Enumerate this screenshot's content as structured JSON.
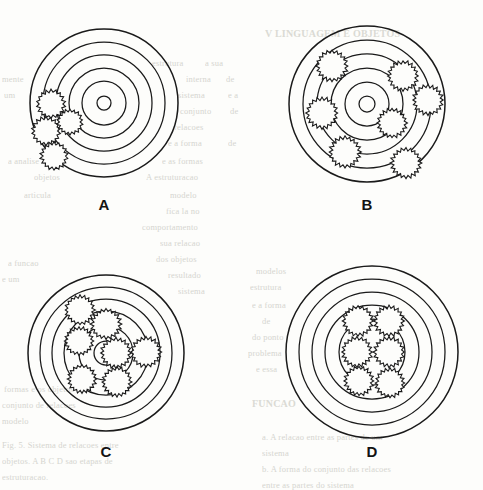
{
  "figure": {
    "kind": "scanned-textbook-figure",
    "background_color": "#fdfdfb",
    "ink_color": "#1a1a1a",
    "bleed_text_color": "#cfcfc9",
    "panel_count": 4
  },
  "panels": [
    {
      "id": "A",
      "label": "A",
      "label_x": 104,
      "label_y": 196,
      "center": {
        "x": 104,
        "y": 103
      },
      "rings": [
        74,
        61,
        48,
        35,
        22,
        7
      ],
      "ring_count": 6,
      "gear_count": 4,
      "gear_teeth": 18,
      "gears": [
        {
          "cx": 51,
          "cy": 104,
          "r": 14.5
        },
        {
          "cx": 46,
          "cy": 131,
          "r": 14.5
        },
        {
          "cx": 70,
          "cy": 122,
          "r": 13.0
        },
        {
          "cx": 54,
          "cy": 156,
          "r": 14.0
        }
      ],
      "description": "Four gears clustered along the left flank, overlapping the outer rings."
    },
    {
      "id": "B",
      "label": "B",
      "label_x": 367,
      "label_y": 196,
      "center": {
        "x": 367,
        "y": 104
      },
      "rings": [
        78,
        64,
        50,
        36,
        22,
        8
      ],
      "ring_count": 6,
      "gear_count": 7,
      "gear_teeth": 20,
      "gears": [
        {
          "cx": 332,
          "cy": 66,
          "r": 16.0
        },
        {
          "cx": 403,
          "cy": 76,
          "r": 15.5
        },
        {
          "cx": 428,
          "cy": 100,
          "r": 15.5
        },
        {
          "cx": 322,
          "cy": 113,
          "r": 16.0
        },
        {
          "cx": 392,
          "cy": 123,
          "r": 15.0
        },
        {
          "cx": 345,
          "cy": 152,
          "r": 16.0
        },
        {
          "cx": 406,
          "cy": 163,
          "r": 15.5
        }
      ],
      "description": "Seven gears spread evenly across the middle and outer rings."
    },
    {
      "id": "C",
      "label": "C",
      "label_x": 106,
      "label_y": 443,
      "center": {
        "x": 106,
        "y": 353
      },
      "rings": [
        78,
        66,
        54,
        42,
        27,
        12
      ],
      "ring_count": 6,
      "gear_count": 7,
      "gear_teeth": 20,
      "gears": [
        {
          "cx": 80,
          "cy": 310,
          "r": 15.0
        },
        {
          "cx": 106,
          "cy": 324,
          "r": 15.5
        },
        {
          "cx": 79,
          "cy": 341,
          "r": 14.5
        },
        {
          "cx": 116,
          "cy": 353,
          "r": 15.5
        },
        {
          "cx": 146,
          "cy": 352,
          "r": 15.5
        },
        {
          "cx": 82,
          "cy": 379,
          "r": 14.5
        },
        {
          "cx": 117,
          "cy": 382,
          "r": 15.0
        }
      ],
      "description": "Seven gears packed into the inner half of the disc."
    },
    {
      "id": "D",
      "label": "D",
      "label_x": 372,
      "label_y": 443,
      "center": {
        "x": 372,
        "y": 352
      },
      "rings": [
        86,
        73,
        60,
        47,
        33
      ],
      "ring_count": 5,
      "gear_count": 6,
      "gear_teeth": 20,
      "gears": [
        {
          "cx": 358,
          "cy": 321,
          "r": 15.5
        },
        {
          "cx": 389,
          "cy": 321,
          "r": 15.5
        },
        {
          "cx": 357,
          "cy": 352,
          "r": 15.5
        },
        {
          "cx": 389,
          "cy": 352,
          "r": 15.5
        },
        {
          "cx": 359,
          "cy": 381,
          "r": 15.0
        },
        {
          "cx": 390,
          "cy": 383,
          "r": 15.0
        }
      ],
      "description": "Six gears in a tight two-by-three block at the core."
    }
  ],
  "bleed_text": [
    {
      "text": "V LINGUAGEM E OBJETOS",
      "x": 265,
      "y": 28,
      "bold": true
    },
    {
      "text": "estrutura",
      "x": 152,
      "y": 58
    },
    {
      "text": "a sua",
      "x": 205,
      "y": 58
    },
    {
      "text": "mente",
      "x": 2,
      "y": 74
    },
    {
      "text": "interna",
      "x": 186,
      "y": 74
    },
    {
      "text": "de",
      "x": 226,
      "y": 74
    },
    {
      "text": "um",
      "x": 4,
      "y": 90
    },
    {
      "text": "sistema",
      "x": 178,
      "y": 90
    },
    {
      "text": "e a",
      "x": 228,
      "y": 90
    },
    {
      "text": "conjunto",
      "x": 180,
      "y": 106
    },
    {
      "text": "de",
      "x": 230,
      "y": 106
    },
    {
      "text": "relacoes",
      "x": 174,
      "y": 122
    },
    {
      "text": "e a forma",
      "x": 168,
      "y": 138
    },
    {
      "text": "de",
      "x": 228,
      "y": 138
    },
    {
      "text": "a analise",
      "x": 8,
      "y": 156
    },
    {
      "text": "e as formas",
      "x": 162,
      "y": 156
    },
    {
      "text": "objetos",
      "x": 34,
      "y": 172
    },
    {
      "text": "A estruturacao",
      "x": 146,
      "y": 172
    },
    {
      "text": "modelo",
      "x": 170,
      "y": 190
    },
    {
      "text": "articula",
      "x": 24,
      "y": 190
    },
    {
      "text": "fica la no",
      "x": 166,
      "y": 206
    },
    {
      "text": "comportamento",
      "x": 142,
      "y": 222
    },
    {
      "text": "sua relacao",
      "x": 160,
      "y": 238
    },
    {
      "text": "dos objetos",
      "x": 156,
      "y": 254
    },
    {
      "text": "resultado",
      "x": 168,
      "y": 270
    },
    {
      "text": "sistema",
      "x": 178,
      "y": 286
    },
    {
      "text": "a funcao",
      "x": 8,
      "y": 258
    },
    {
      "text": "modelos",
      "x": 256,
      "y": 266
    },
    {
      "text": "e um",
      "x": 2,
      "y": 274
    },
    {
      "text": "estrutura",
      "x": 250,
      "y": 282
    },
    {
      "text": "e a forma",
      "x": 252,
      "y": 300
    },
    {
      "text": "de",
      "x": 262,
      "y": 316
    },
    {
      "text": "do ponto",
      "x": 252,
      "y": 332
    },
    {
      "text": "problema",
      "x": 248,
      "y": 348
    },
    {
      "text": "e essa",
      "x": 256,
      "y": 364
    },
    {
      "text": "FUNCAO",
      "x": 252,
      "y": 398,
      "bold": true
    },
    {
      "text": "formas e os objetos",
      "x": 4,
      "y": 384
    },
    {
      "text": "conjunto de relacoes",
      "x": 2,
      "y": 400
    },
    {
      "text": "modelo",
      "x": 2,
      "y": 416
    },
    {
      "text": "Fig. 5. Sistema de relacoes entre",
      "x": 2,
      "y": 440
    },
    {
      "text": "objetos. A B C D sao etapas de",
      "x": 2,
      "y": 456
    },
    {
      "text": "estruturacao.",
      "x": 2,
      "y": 472
    },
    {
      "text": "a. A relacao entre as partes de um",
      "x": 262,
      "y": 432
    },
    {
      "text": "sistema",
      "x": 262,
      "y": 448
    },
    {
      "text": "b. A forma do conjunto das relacoes",
      "x": 262,
      "y": 464
    },
    {
      "text": "entre as partes do sistema",
      "x": 262,
      "y": 480
    }
  ]
}
